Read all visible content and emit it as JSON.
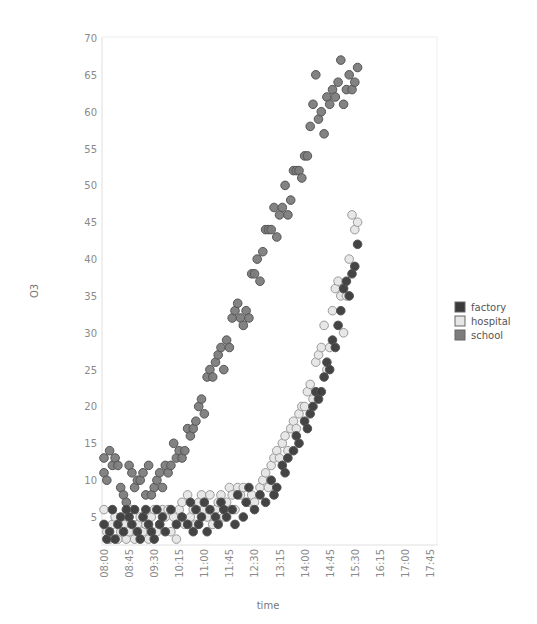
{
  "chart_data": {
    "type": "scatter",
    "title": "",
    "xlabel": "time",
    "ylabel": "O3",
    "ylim": [
      1.5,
      70
    ],
    "yticks": [
      5,
      10,
      15,
      20,
      25,
      30,
      35,
      40,
      45,
      50,
      55,
      60,
      65,
      70
    ],
    "xticks": [
      "08:00",
      "08:45",
      "09:30",
      "10:15",
      "11:00",
      "11:45",
      "12:30",
      "13:15",
      "14:00",
      "14:45",
      "15:30",
      "16:15",
      "17:00",
      "17:45"
    ],
    "x_unit": "minutes since 08:00",
    "xlim": [
      0,
      600
    ],
    "grid": false,
    "legend_position": "right",
    "legend": [
      "factory",
      "hospital",
      "school"
    ],
    "colors": {
      "factory": "#3a3a3a",
      "hospital": "#e6e6e6",
      "school": "#7c7c7c"
    },
    "series": [
      {
        "name": "factory",
        "points": [
          [
            0,
            4
          ],
          [
            5,
            2
          ],
          [
            10,
            3
          ],
          [
            15,
            6
          ],
          [
            20,
            2
          ],
          [
            25,
            4
          ],
          [
            30,
            5
          ],
          [
            35,
            3
          ],
          [
            40,
            6
          ],
          [
            45,
            5
          ],
          [
            50,
            4
          ],
          [
            55,
            6
          ],
          [
            60,
            3
          ],
          [
            65,
            2
          ],
          [
            70,
            5
          ],
          [
            75,
            6
          ],
          [
            80,
            4
          ],
          [
            85,
            3
          ],
          [
            90,
            2
          ],
          [
            95,
            6
          ],
          [
            100,
            4
          ],
          [
            105,
            5
          ],
          [
            110,
            3
          ],
          [
            120,
            6
          ],
          [
            130,
            4
          ],
          [
            140,
            5
          ],
          [
            150,
            4
          ],
          [
            155,
            7
          ],
          [
            160,
            3
          ],
          [
            165,
            6
          ],
          [
            170,
            4
          ],
          [
            175,
            5
          ],
          [
            180,
            7
          ],
          [
            185,
            3
          ],
          [
            190,
            6
          ],
          [
            200,
            5
          ],
          [
            205,
            4
          ],
          [
            210,
            7
          ],
          [
            215,
            6
          ],
          [
            220,
            5
          ],
          [
            230,
            6
          ],
          [
            235,
            4
          ],
          [
            240,
            8
          ],
          [
            250,
            5
          ],
          [
            255,
            7
          ],
          [
            260,
            9
          ],
          [
            270,
            6
          ],
          [
            280,
            8
          ],
          [
            290,
            7
          ],
          [
            300,
            10
          ],
          [
            305,
            8
          ],
          [
            310,
            9
          ],
          [
            320,
            12
          ],
          [
            325,
            11
          ],
          [
            330,
            13
          ],
          [
            340,
            14
          ],
          [
            345,
            16
          ],
          [
            350,
            15
          ],
          [
            360,
            18
          ],
          [
            365,
            17
          ],
          [
            370,
            19
          ],
          [
            375,
            20
          ],
          [
            380,
            22
          ],
          [
            385,
            21
          ],
          [
            390,
            22
          ],
          [
            395,
            24
          ],
          [
            400,
            26
          ],
          [
            405,
            25
          ],
          [
            410,
            29
          ],
          [
            415,
            28
          ],
          [
            420,
            31
          ],
          [
            425,
            33
          ],
          [
            430,
            36
          ],
          [
            435,
            37
          ],
          [
            440,
            35
          ],
          [
            445,
            38
          ],
          [
            450,
            39
          ],
          [
            455,
            42
          ]
        ]
      },
      {
        "name": "hospital",
        "points": [
          [
            0,
            6
          ],
          [
            5,
            3
          ],
          [
            10,
            2
          ],
          [
            15,
            4
          ],
          [
            20,
            5
          ],
          [
            25,
            2
          ],
          [
            30,
            3
          ],
          [
            35,
            4
          ],
          [
            40,
            2
          ],
          [
            45,
            3
          ],
          [
            50,
            6
          ],
          [
            55,
            2
          ],
          [
            60,
            4
          ],
          [
            65,
            5
          ],
          [
            70,
            3
          ],
          [
            75,
            4
          ],
          [
            80,
            2
          ],
          [
            85,
            5
          ],
          [
            90,
            6
          ],
          [
            95,
            3
          ],
          [
            100,
            4
          ],
          [
            105,
            6
          ],
          [
            110,
            5
          ],
          [
            115,
            6
          ],
          [
            120,
            3
          ],
          [
            125,
            5
          ],
          [
            130,
            2
          ],
          [
            135,
            6
          ],
          [
            140,
            7
          ],
          [
            145,
            4
          ],
          [
            150,
            8
          ],
          [
            155,
            5
          ],
          [
            160,
            6
          ],
          [
            165,
            4
          ],
          [
            170,
            7
          ],
          [
            175,
            8
          ],
          [
            180,
            6
          ],
          [
            185,
            5
          ],
          [
            190,
            8
          ],
          [
            195,
            4
          ],
          [
            200,
            6
          ],
          [
            205,
            7
          ],
          [
            210,
            8
          ],
          [
            215,
            5
          ],
          [
            220,
            7
          ],
          [
            225,
            9
          ],
          [
            230,
            8
          ],
          [
            235,
            6
          ],
          [
            240,
            9
          ],
          [
            245,
            8
          ],
          [
            250,
            9
          ],
          [
            260,
            7
          ],
          [
            265,
            8
          ],
          [
            270,
            7
          ],
          [
            280,
            9
          ],
          [
            285,
            10
          ],
          [
            290,
            11
          ],
          [
            295,
            9
          ],
          [
            300,
            12
          ],
          [
            305,
            13
          ],
          [
            310,
            14
          ],
          [
            315,
            13
          ],
          [
            320,
            15
          ],
          [
            325,
            16
          ],
          [
            330,
            14
          ],
          [
            335,
            17
          ],
          [
            340,
            18
          ],
          [
            345,
            17
          ],
          [
            350,
            19
          ],
          [
            355,
            20
          ],
          [
            360,
            20
          ],
          [
            365,
            22
          ],
          [
            370,
            23
          ],
          [
            375,
            21
          ],
          [
            380,
            26
          ],
          [
            385,
            27
          ],
          [
            390,
            28
          ],
          [
            395,
            31
          ],
          [
            400,
            25
          ],
          [
            405,
            28
          ],
          [
            410,
            33
          ],
          [
            415,
            36
          ],
          [
            420,
            37
          ],
          [
            425,
            35
          ],
          [
            430,
            30
          ],
          [
            435,
            35
          ],
          [
            440,
            40
          ],
          [
            445,
            46
          ],
          [
            450,
            44
          ],
          [
            455,
            45
          ]
        ]
      },
      {
        "name": "school",
        "points": [
          [
            0,
            13
          ],
          [
            0,
            11
          ],
          [
            5,
            10
          ],
          [
            10,
            14
          ],
          [
            15,
            12
          ],
          [
            20,
            13
          ],
          [
            25,
            12
          ],
          [
            30,
            9
          ],
          [
            35,
            8
          ],
          [
            40,
            7
          ],
          [
            45,
            12
          ],
          [
            50,
            11
          ],
          [
            55,
            9
          ],
          [
            60,
            10
          ],
          [
            65,
            10
          ],
          [
            70,
            11
          ],
          [
            75,
            8
          ],
          [
            80,
            12
          ],
          [
            85,
            8
          ],
          [
            90,
            9
          ],
          [
            95,
            10
          ],
          [
            100,
            11
          ],
          [
            105,
            9
          ],
          [
            110,
            12
          ],
          [
            115,
            11
          ],
          [
            120,
            12
          ],
          [
            125,
            15
          ],
          [
            130,
            13
          ],
          [
            135,
            14
          ],
          [
            140,
            13
          ],
          [
            145,
            14
          ],
          [
            150,
            17
          ],
          [
            155,
            16
          ],
          [
            160,
            17
          ],
          [
            165,
            18
          ],
          [
            170,
            20
          ],
          [
            175,
            21
          ],
          [
            180,
            19
          ],
          [
            185,
            24
          ],
          [
            190,
            25
          ],
          [
            195,
            24
          ],
          [
            200,
            26
          ],
          [
            205,
            27
          ],
          [
            210,
            28
          ],
          [
            215,
            25
          ],
          [
            220,
            29
          ],
          [
            225,
            28
          ],
          [
            230,
            32
          ],
          [
            235,
            33
          ],
          [
            240,
            34
          ],
          [
            245,
            32
          ],
          [
            250,
            31
          ],
          [
            255,
            33
          ],
          [
            260,
            32
          ],
          [
            265,
            38
          ],
          [
            270,
            38
          ],
          [
            275,
            40
          ],
          [
            280,
            37
          ],
          [
            285,
            41
          ],
          [
            290,
            44
          ],
          [
            295,
            44
          ],
          [
            300,
            44
          ],
          [
            305,
            47
          ],
          [
            310,
            43
          ],
          [
            315,
            46
          ],
          [
            320,
            47
          ],
          [
            325,
            50
          ],
          [
            330,
            46
          ],
          [
            335,
            48
          ],
          [
            340,
            52
          ],
          [
            345,
            52
          ],
          [
            350,
            52
          ],
          [
            355,
            51
          ],
          [
            360,
            54
          ],
          [
            365,
            54
          ],
          [
            370,
            58
          ],
          [
            375,
            61
          ],
          [
            380,
            65
          ],
          [
            385,
            59
          ],
          [
            390,
            60
          ],
          [
            395,
            57
          ],
          [
            400,
            62
          ],
          [
            405,
            61
          ],
          [
            410,
            63
          ],
          [
            415,
            62
          ],
          [
            420,
            64
          ],
          [
            425,
            67
          ],
          [
            430,
            61
          ],
          [
            435,
            63
          ],
          [
            440,
            65
          ],
          [
            445,
            63
          ],
          [
            450,
            64
          ],
          [
            455,
            66
          ]
        ]
      }
    ]
  }
}
